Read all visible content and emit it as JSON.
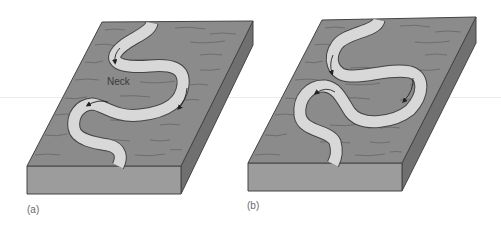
{
  "figure": {
    "panels": [
      {
        "id": "a",
        "label": "(a)",
        "annotation": "Neck",
        "description": "Meandering river on block diagram with narrowing neck between meander loops"
      },
      {
        "id": "b",
        "label": "(b)",
        "description": "Meander loops closer together, neck nearly cut off"
      }
    ],
    "colors": {
      "surface": "#8b8b8b",
      "front_face": "#9c9c9c",
      "side_face": "#707070",
      "river": "#d8d8d8",
      "outline": "#4a4a4a",
      "texture": "#5e5e5e"
    }
  }
}
